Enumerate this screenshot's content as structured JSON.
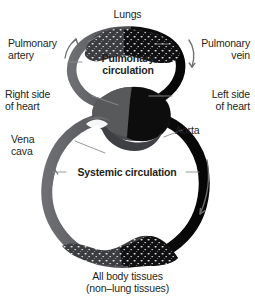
{
  "figure": {
    "background_color": "#ffffff",
    "text_color": "#231f20"
  },
  "palette": {
    "deoxygenated_gray": "#58595b",
    "oxygenated_black": "#0f0f10",
    "leader_line": "#808285",
    "arrow": "#6d6e71",
    "capillary_speck": "#ffffff"
  },
  "labels": {
    "lungs": "Lungs",
    "pulmonary_artery": "Pulmonary\nartery",
    "pulmonary_vein": "Pulmonary\nvein",
    "right_side_of_heart": "Right side\nof heart",
    "left_side_of_heart": "Left side\nof heart",
    "vena_cava": "Vena\ncava",
    "aorta": "Aorta",
    "pulmonary_circulation": "Pulmonary\ncirculation",
    "systemic_circulation": "Systemic circulation",
    "all_body_tissues": "All body tissues",
    "all_body_tissues_sub": "(non–lung tissues)"
  },
  "icons": {
    "lungs_capillary_bed": "lungs-capillary-bed-icon",
    "tissue_capillary_bed": "tissue-capillary-bed-icon",
    "heart": "heart-icon",
    "heart_valve": "heart-valve-icon",
    "arrow_pulmonary_artery": "arrow-up-left-icon",
    "arrow_pulmonary_vein": "arrow-down-right-icon",
    "arrow_systemic_left": "arrow-up-icon",
    "arrow_systemic_right": "arrow-down-icon"
  },
  "flow": {
    "pulmonary_direction": "right heart → lungs → left heart",
    "systemic_direction": "left heart → body tissues → right heart"
  }
}
